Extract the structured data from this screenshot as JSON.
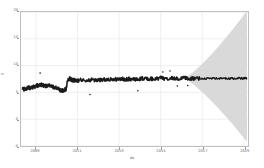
{
  "chart_data": {
    "type": "line",
    "title": "",
    "xlabel": "ds",
    "ylabel": "y",
    "xlim": [
      "2008-03-01",
      "2019-03-01"
    ],
    "ylim": [
      -5,
      20
    ],
    "grid": true,
    "legend_position": "none",
    "y_ticks": [
      -5,
      0,
      5,
      10,
      15,
      20
    ],
    "y_tick_labels": [
      "-5",
      "0",
      "5",
      "10",
      "15",
      "20"
    ],
    "x_ticks": [
      "2009",
      "2011",
      "2013",
      "2015",
      "2017",
      "2019"
    ],
    "x_tick_labels": [
      "2009",
      "2011",
      "2013",
      "2015",
      "2017",
      "2019"
    ],
    "series": [
      {
        "name": "observed",
        "color": "#1a1a1a",
        "kind": "noisy-line-with-points",
        "x": [
          "2008.35",
          "2008.45",
          "2008.55",
          "2008.65",
          "2008.75",
          "2008.85",
          "2008.95",
          "2009.05",
          "2009.15",
          "2009.25",
          "2009.35",
          "2009.45",
          "2009.55",
          "2009.65",
          "2009.75",
          "2009.85",
          "2009.95",
          "2010.05",
          "2010.15",
          "2010.25",
          "2010.35",
          "2010.45",
          "2010.55",
          "2010.65",
          "2010.75",
          "2010.85",
          "2010.95",
          "2011.1",
          "2011.3",
          "2011.5",
          "2011.7",
          "2011.9",
          "2012.1",
          "2012.3",
          "2012.5",
          "2012.7",
          "2012.9",
          "2013.1",
          "2013.3",
          "2013.5",
          "2013.7",
          "2013.9",
          "2014.1",
          "2014.3",
          "2014.5",
          "2014.7",
          "2014.9",
          "2015.1",
          "2015.3",
          "2015.5",
          "2015.7",
          "2015.9",
          "2016.1",
          "2016.3",
          "2016.5",
          "2016.7",
          "2016.9"
        ],
        "values": [
          5.5,
          5.6,
          5.75,
          5.9,
          5.85,
          6.0,
          6.1,
          6.3,
          6.25,
          6.4,
          6.35,
          6.2,
          6.3,
          6.2,
          6.1,
          6.0,
          5.9,
          5.7,
          5.5,
          5.35,
          5.45,
          5.6,
          7.6,
          7.5,
          7.35,
          7.25,
          7.2,
          7.3,
          7.25,
          7.3,
          7.35,
          7.3,
          7.35,
          7.4,
          7.45,
          7.4,
          7.45,
          7.5,
          7.45,
          7.5,
          7.55,
          7.5,
          7.55,
          7.6,
          7.55,
          7.6,
          7.6,
          7.65,
          7.6,
          7.65,
          7.6,
          7.65,
          7.6,
          7.6,
          7.62,
          7.6,
          7.6
        ]
      },
      {
        "name": "forecast",
        "color": "#1a1a1a",
        "kind": "line",
        "x": [
          "2016.9",
          "2017.2",
          "2017.5",
          "2017.8",
          "2018.1",
          "2018.4",
          "2018.7",
          "2019.0",
          "2019.15"
        ],
        "values": [
          7.6,
          7.6,
          7.62,
          7.6,
          7.62,
          7.6,
          7.62,
          7.6,
          7.6
        ]
      }
    ],
    "uncertainty_band": {
      "name": "forecast uncertainty interval",
      "color": "#d9d9d9",
      "start_x": "2016.1",
      "end_x": "2019.15",
      "upper_end": 20.2,
      "lower_end": -4.2,
      "center": 7.6
    },
    "outlier_points": [
      {
        "x": "2009.2",
        "y": 8.6
      },
      {
        "x": "2011.6",
        "y": 4.6
      },
      {
        "x": "2013.9",
        "y": 5.3
      },
      {
        "x": "2015.1",
        "y": 8.8
      },
      {
        "x": "2015.45",
        "y": 9.0
      },
      {
        "x": "2015.8",
        "y": 6.2
      },
      {
        "x": "2016.3",
        "y": 6.3
      }
    ]
  }
}
